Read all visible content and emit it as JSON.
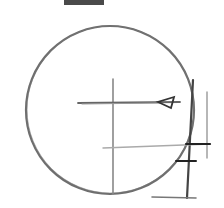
{
  "sketch": {
    "description": "pencil sketch of circle with crosshair, arrow and tick marks",
    "stroke_color": "#555555",
    "dark_stroke_color": "#222222",
    "top_bar_color": "#4a4a4a"
  }
}
